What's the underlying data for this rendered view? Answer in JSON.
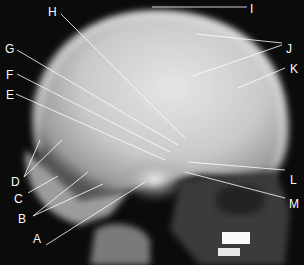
{
  "figure": {
    "labels": [
      {
        "id": "A",
        "text": "A",
        "x": 33,
        "y": 233
      },
      {
        "id": "B",
        "text": "B",
        "x": 18,
        "y": 213
      },
      {
        "id": "C",
        "text": "C",
        "x": 14,
        "y": 193
      },
      {
        "id": "D",
        "text": "D",
        "x": 11,
        "y": 176
      },
      {
        "id": "E",
        "text": "E",
        "x": 6,
        "y": 89
      },
      {
        "id": "F",
        "text": "F",
        "x": 6,
        "y": 69
      },
      {
        "id": "G",
        "text": "G",
        "x": 5,
        "y": 43
      },
      {
        "id": "H",
        "text": "H",
        "x": 48,
        "y": 6
      },
      {
        "id": "I",
        "text": "I",
        "x": 250,
        "y": 3
      },
      {
        "id": "J",
        "text": "J",
        "x": 286,
        "y": 43
      },
      {
        "id": "K",
        "text": "K",
        "x": 290,
        "y": 63
      },
      {
        "id": "L",
        "text": "L",
        "x": 290,
        "y": 174
      },
      {
        "id": "M",
        "text": "M",
        "x": 289,
        "y": 198
      }
    ]
  }
}
